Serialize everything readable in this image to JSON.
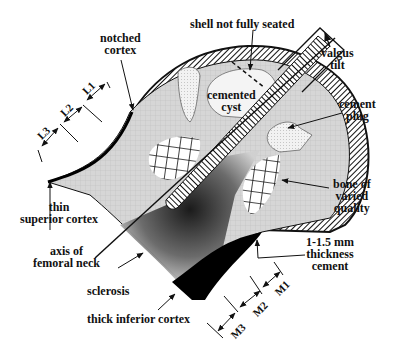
{
  "diagram": {
    "labels": {
      "notched_cortex": [
        "notched",
        "cortex"
      ],
      "shell_not_seated": [
        "shell not fully seated"
      ],
      "valgus_tilt": [
        "valgus",
        "tilt"
      ],
      "cemented_cyst": [
        "cemented",
        "cyst"
      ],
      "cement_plug": [
        "cement",
        "plug"
      ],
      "bone_varied_quality": [
        "bone of",
        "varied",
        "quality"
      ],
      "cement_thickness": [
        "1-1.5 mm",
        "thickness",
        "cement"
      ],
      "thin_superior_cortex": [
        "thin",
        "superior cortex"
      ],
      "axis_femoral_neck": [
        "axis of",
        "femoral neck"
      ],
      "sclerosis": [
        "sclerosis"
      ],
      "thick_inferior_cortex": [
        "thick inferior cortex"
      ]
    },
    "dimensions": {
      "superior": [
        "L1",
        "L2",
        "L3"
      ],
      "inferior": [
        "M1",
        "M2",
        "M3"
      ]
    },
    "colors": {
      "bone": "#d4d4d4",
      "cortex": "#000000",
      "cement": "#eeeeee",
      "outline": "#111111"
    }
  }
}
